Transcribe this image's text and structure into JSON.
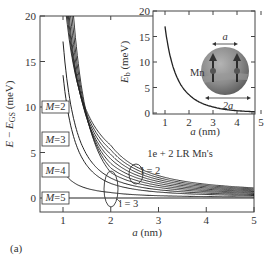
{
  "chart_data": [
    {
      "type": "line",
      "title": "",
      "xlabel": "a (nm)",
      "ylabel": "E − E_GS (meV)",
      "xlim": [
        0.5,
        5
      ],
      "ylim": [
        -1.5,
        20
      ],
      "xticks": [
        "1",
        "2",
        "3",
        "4",
        "5"
      ],
      "yticks": [
        "0",
        "5",
        "10",
        "15",
        "20"
      ],
      "grid": false,
      "annotation": "1e + 2 LR Mn's",
      "panel_label": "(a)",
      "level_labels": [
        "M = 2",
        "M = 3",
        "M = 4",
        "M = 5"
      ],
      "ellipse_labels": [
        "l = 3",
        "l = 2"
      ],
      "series": [
        {
          "name": "level 1",
          "a_at_E20": 1.07,
          "E_at_a2": 5.8,
          "E_at_a5": 0.5
        },
        {
          "name": "level 2",
          "a_at_E20": 1.09,
          "E_at_a2": 5.3,
          "E_at_a5": 0.45
        },
        {
          "name": "level 3",
          "a_at_E20": 1.11,
          "E_at_a2": 4.8,
          "E_at_a5": 0.4
        },
        {
          "name": "level 4",
          "a_at_E20": 1.13,
          "E_at_a2": 4.3,
          "E_at_a5": 0.35
        },
        {
          "name": "level 5",
          "a_at_E20": 1.16,
          "E_at_a2": 3.8,
          "E_at_a5": 0.3
        },
        {
          "name": "level 6",
          "a_at_E20": 1.19,
          "E_at_a2": 3.3,
          "E_at_a5": 0.25
        },
        {
          "name": "level 7",
          "a_at_E20": 1.22,
          "E_at_a2": 2.8,
          "E_at_a5": 0.2
        },
        {
          "name": "M = 2 branch",
          "a_start": 1.0,
          "E_start": 17.2,
          "E_at_a2": 2.2,
          "E_at_a5": 0.15
        },
        {
          "name": "M = 3 branch",
          "a_start": 1.0,
          "E_start": 13.5,
          "E_at_a2": 1.6,
          "E_at_a5": 0.1
        },
        {
          "name": "M = 4 branch",
          "a_start": 1.0,
          "E_start": 3.0,
          "E_at_a2": 0.6,
          "E_at_a5": 0.05
        },
        {
          "name": "M = 5",
          "constant": 0.0
        }
      ]
    },
    {
      "type": "line",
      "title": "inset",
      "xlabel": "a (nm)",
      "ylabel": "E_b (meV)",
      "xlim": [
        0.5,
        5
      ],
      "ylim": [
        0,
        20
      ],
      "xticks": [
        "1",
        "2",
        "3",
        "4",
        "5"
      ],
      "yticks": [
        "0",
        "5",
        "10",
        "15",
        "20"
      ],
      "series": [
        {
          "name": "E_b",
          "x": [
            1.0,
            1.25,
            1.5,
            2.0,
            2.5,
            3.0,
            3.5,
            4.0,
            4.5,
            5.0
          ],
          "values": [
            17.0,
            10.5,
            7.0,
            3.6,
            2.0,
            1.2,
            0.7,
            0.45,
            0.3,
            0.2
          ]
        }
      ],
      "schematic": {
        "label_mn": "Mn",
        "label_a": "a",
        "label_2a": "2a"
      }
    }
  ]
}
